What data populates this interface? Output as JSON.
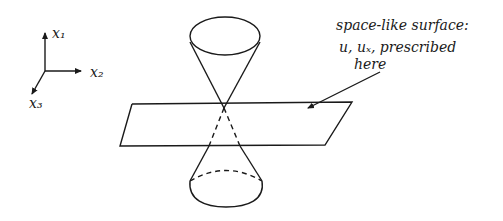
{
  "diagram": {
    "type": "light-cone-cauchy-surface",
    "axes": {
      "x1": "x₁",
      "x2": "x₂",
      "x3": "x₃"
    },
    "annotation": {
      "line1": "space-like surface:",
      "line2": "u, uₓ, prescribed",
      "line3": "here"
    },
    "colors": {
      "ink": "#1a1a1a",
      "background": "#ffffff"
    }
  }
}
